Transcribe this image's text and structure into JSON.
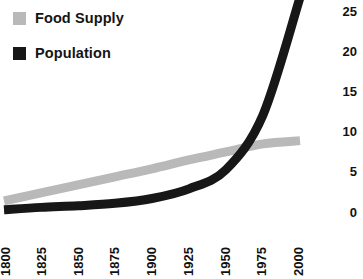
{
  "chart_data": {
    "type": "line",
    "title": "",
    "subtitle": "",
    "xlabel": "",
    "ylabel": "",
    "x": [
      1800,
      1825,
      1850,
      1875,
      1900,
      1925,
      1950,
      1975,
      2000
    ],
    "xticklabels": [
      "1800",
      "1825",
      "1850",
      "1875",
      "1900",
      "1925",
      "1950",
      "1975",
      "2000"
    ],
    "yticklabels": [
      "0",
      "5",
      "10",
      "15",
      "20",
      "25"
    ],
    "yticks": [
      0,
      5,
      10,
      15,
      20,
      25
    ],
    "xlim": [
      1800,
      2000
    ],
    "ylim": [
      0,
      27
    ],
    "grid": false,
    "legend_position": "top-left",
    "series": [
      {
        "name": "Food Supply",
        "color": "#b9b9b9",
        "values": [
          1.5,
          2.5,
          3.5,
          4.5,
          5.5,
          6.6,
          7.6,
          8.6,
          9.0
        ]
      },
      {
        "name": "Population",
        "color": "#171717",
        "values": [
          0.4,
          0.7,
          0.9,
          1.2,
          1.8,
          3.0,
          5.4,
          12.2,
          26.8
        ]
      }
    ]
  },
  "legend": {
    "items": [
      {
        "label": "Food Supply",
        "color": "#b9b9b9"
      },
      {
        "label": "Population",
        "color": "#171717"
      }
    ]
  },
  "axes": {
    "y": {
      "labels": [
        "25",
        "20",
        "15",
        "10",
        "5",
        "0"
      ]
    },
    "x": {
      "labels": [
        "1800",
        "1825",
        "1850",
        "1875",
        "1900",
        "1925",
        "1950",
        "1975",
        "2000"
      ]
    }
  },
  "colors": {
    "food_supply": "#b9b9b9",
    "population": "#171717",
    "background": "#ffffff",
    "text": "#111111"
  }
}
